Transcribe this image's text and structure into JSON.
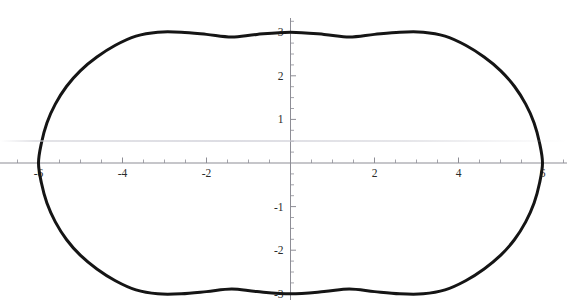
{
  "figure": {
    "background_color": "#ffffff",
    "curve_color": "#151515",
    "axis_color": "#8d8d95",
    "label_color": "#2b2b2b",
    "width": 567,
    "height": 300
  },
  "chart_data": {
    "type": "line",
    "title": "",
    "subtitle": "",
    "xlabel": "",
    "ylabel": "",
    "shape": "ellipse",
    "equation": "x^2/36 + y^2/9 = 1",
    "semi_axis_x": 6,
    "semi_axis_y": 3,
    "center": [
      0,
      0
    ],
    "xlim": [
      -6.9,
      6.6
    ],
    "ylim": [
      -3.15,
      3.05
    ],
    "grid": false,
    "legend": false,
    "axes_through_origin": true,
    "x_major_ticks": [
      -6,
      -4,
      -2,
      2,
      4,
      6
    ],
    "x_tick_labels": [
      "-6",
      "-4",
      "-2",
      "2",
      "4",
      "6"
    ],
    "y_major_ticks": [
      3,
      2,
      1,
      -1,
      -2,
      -3
    ],
    "y_tick_labels": [
      "3",
      "2",
      "1",
      "-1",
      "-2",
      "-3"
    ],
    "x_minor_step": 0.5,
    "y_minor_step": 0.25,
    "x_vertices": [
      -6,
      6
    ],
    "y_vertices": [
      -3,
      3
    ],
    "series": [
      {
        "name": "ellipse",
        "stroke_width": 3,
        "points": [
          [
            6.0,
            0.0
          ],
          [
            5.93,
            0.46
          ],
          [
            5.8,
            0.92
          ],
          [
            5.6,
            1.35
          ],
          [
            5.33,
            1.76
          ],
          [
            5.0,
            2.12
          ],
          [
            4.61,
            2.43
          ],
          [
            4.17,
            2.7
          ],
          [
            3.68,
            2.91
          ],
          [
            3.16,
            3.0
          ],
          [
            2.6,
            3.0
          ],
          [
            2.0,
            2.95
          ],
          [
            1.4,
            2.89
          ],
          [
            0.8,
            2.95
          ],
          [
            0.0,
            3.0
          ],
          [
            -0.8,
            2.95
          ],
          [
            -1.4,
            2.89
          ],
          [
            -2.0,
            2.95
          ],
          [
            -2.6,
            3.0
          ],
          [
            -3.16,
            3.0
          ],
          [
            -3.68,
            2.91
          ],
          [
            -4.17,
            2.7
          ],
          [
            -4.61,
            2.43
          ],
          [
            -5.0,
            2.12
          ],
          [
            -5.33,
            1.76
          ],
          [
            -5.6,
            1.35
          ],
          [
            -5.8,
            0.92
          ],
          [
            -5.93,
            0.46
          ],
          [
            -6.0,
            0.0
          ],
          [
            -5.93,
            -0.46
          ],
          [
            -5.8,
            -0.92
          ],
          [
            -5.6,
            -1.35
          ],
          [
            -5.33,
            -1.76
          ],
          [
            -5.0,
            -2.12
          ],
          [
            -4.61,
            -2.43
          ],
          [
            -4.17,
            -2.7
          ],
          [
            -3.68,
            -2.91
          ],
          [
            -3.16,
            -3.0
          ],
          [
            -2.6,
            -3.0
          ],
          [
            -2.0,
            -2.95
          ],
          [
            -1.4,
            -2.89
          ],
          [
            -0.8,
            -2.95
          ],
          [
            0.0,
            -3.0
          ],
          [
            0.8,
            -2.95
          ],
          [
            1.4,
            -2.89
          ],
          [
            2.0,
            -2.95
          ],
          [
            2.6,
            -3.0
          ],
          [
            3.16,
            -3.0
          ],
          [
            3.68,
            -2.91
          ],
          [
            4.17,
            -2.7
          ],
          [
            4.61,
            -2.43
          ],
          [
            5.0,
            -2.12
          ],
          [
            5.33,
            -1.76
          ],
          [
            5.6,
            -1.35
          ],
          [
            5.8,
            -0.92
          ],
          [
            5.93,
            -0.46
          ],
          [
            6.0,
            0.0
          ]
        ]
      }
    ]
  },
  "artifacts": {
    "scan_line_y": 140
  }
}
